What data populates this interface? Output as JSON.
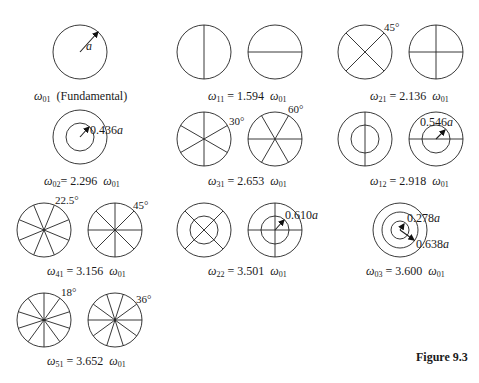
{
  "figure": {
    "label": "Figure 9.3",
    "modes": [
      {
        "id": "01",
        "caption_main": "ω",
        "sub": "01",
        "caption_rest": "(Fundamental)",
        "annotations": [
          "a"
        ]
      },
      {
        "id": "11",
        "sub": "11",
        "value": "1.594",
        "annotations": []
      },
      {
        "id": "21",
        "sub": "21",
        "value": "2.136",
        "annotations": [
          "45°"
        ]
      },
      {
        "id": "02",
        "sub": "02",
        "value": "2.296",
        "annotations": [
          "0.436a"
        ]
      },
      {
        "id": "31",
        "sub": "31",
        "value": "2.653",
        "annotations": [
          "30°",
          "60°"
        ]
      },
      {
        "id": "12",
        "sub": "12",
        "value": "2.918",
        "annotations": [
          "0.546a"
        ]
      },
      {
        "id": "41",
        "sub": "41",
        "value": "3.156",
        "annotations": [
          "22.5°",
          "45°"
        ]
      },
      {
        "id": "22",
        "sub": "22",
        "value": "3.501",
        "annotations": [
          "0.610a"
        ]
      },
      {
        "id": "03",
        "sub": "03",
        "value": "3.600",
        "annotations": [
          "0.278a",
          "0.638a"
        ]
      },
      {
        "id": "51",
        "sub": "51",
        "value": "3.652",
        "annotations": [
          "18°",
          "36°"
        ]
      }
    ],
    "omega": "ω",
    "ref_sub": "01",
    "equals": "="
  }
}
